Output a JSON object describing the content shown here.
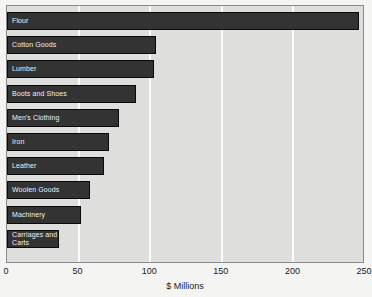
{
  "chart_data": {
    "type": "bar",
    "orientation": "horizontal",
    "title": "",
    "xlabel": "$ Millions",
    "ylabel": "",
    "xlim": [
      0,
      250
    ],
    "xticks": [
      0,
      50,
      100,
      150,
      200,
      250
    ],
    "grid": true,
    "legend": null,
    "categories": [
      "Flour",
      "Cotton Goods",
      "Lumber",
      "Boots and Shoes",
      "Men's Clothing",
      "Iron",
      "Leather",
      "Woolen Goods",
      "Machinery",
      "Carriages and\nCarts"
    ],
    "values": [
      246,
      104,
      103,
      90,
      78,
      71,
      68,
      58,
      52,
      36
    ],
    "colors": {
      "bar_fill": "#333333",
      "bar_border": "#0a0a0a",
      "plot_background": "#dededc",
      "page_background": "#f4f4f2",
      "gridline": "#fbfbfa",
      "bar_label_text": "#f0f0f0",
      "axis_text": "#1a1a1a"
    }
  }
}
